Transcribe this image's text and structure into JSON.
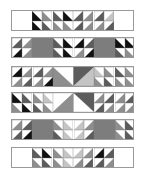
{
  "title": "",
  "colors": {
    "white": "#ffffff",
    "light": "#c4c4c4",
    "mid": "#8e8e8e",
    "dark": "#5c5c5c",
    "black": "#111111",
    "panel": "#7d7d7d",
    "border": "#9a9a9a"
  },
  "rows": [
    {
      "id": "row-1",
      "top": 10,
      "segments": [
        {
          "type": "blank",
          "x": 0,
          "w": 20
        },
        {
          "type": "hst",
          "x": 20,
          "cols": 8,
          "top": [
            "black",
            "mid",
            "dark",
            "black",
            "dark",
            "mid",
            "dark",
            "light"
          ],
          "bottom": [
            "black",
            "dark",
            "mid",
            "mid",
            "dark",
            "mid",
            "mid",
            "dark"
          ],
          "dir": [
            "d",
            "d",
            "d",
            "d",
            "a",
            "a",
            "a",
            "a"
          ]
        },
        {
          "type": "blank",
          "x": 103,
          "w": 20
        }
      ]
    },
    {
      "id": "row-2",
      "top": 37,
      "segments": [
        {
          "type": "hst",
          "x": 0,
          "cols": 2,
          "top": [
            "dark",
            "mid"
          ],
          "bottom": [
            "black",
            "mid"
          ],
          "dir": [
            "a",
            "a"
          ]
        },
        {
          "type": "panel",
          "x": 20,
          "w": 21
        },
        {
          "type": "hst",
          "x": 41,
          "cols": 4,
          "top": [
            "dark",
            "black",
            "black",
            "dark"
          ],
          "bottom": [
            "dark",
            "black",
            "mid",
            "black"
          ],
          "dir": [
            "d",
            "d",
            "a",
            "a"
          ]
        },
        {
          "type": "panel",
          "x": 82,
          "w": 21
        },
        {
          "type": "hst",
          "x": 103,
          "cols": 2,
          "top": [
            "black",
            "black"
          ],
          "bottom": [
            "dark",
            "mid"
          ],
          "dir": [
            "d",
            "d"
          ]
        }
      ]
    },
    {
      "id": "row-3",
      "top": 66,
      "segments": [
        {
          "type": "hst",
          "x": 0,
          "cols": 4,
          "top": [
            "black",
            "mid",
            "dark",
            "mid"
          ],
          "bottom": [
            "mid",
            "dark",
            "mid",
            "black"
          ],
          "dir": [
            "a",
            "a",
            "a",
            "a"
          ]
        },
        {
          "type": "big",
          "x": 41,
          "w": 41,
          "shape": "v",
          "left": "mid",
          "right": "dark",
          "center": "white"
        },
        {
          "type": "hst",
          "x": 82,
          "cols": 4,
          "top": [
            "light",
            "mid",
            "dark",
            "mid"
          ],
          "bottom": [
            "mid",
            "dark",
            "mid",
            "mid"
          ],
          "dir": [
            "d",
            "d",
            "d",
            "d"
          ]
        }
      ]
    },
    {
      "id": "row-4",
      "top": 92,
      "segments": [
        {
          "type": "hst",
          "x": 0,
          "cols": 4,
          "top": [
            "black",
            "dark",
            "mid",
            "light"
          ],
          "bottom": [
            "mid",
            "black",
            "dark",
            "mid"
          ],
          "dir": [
            "d",
            "d",
            "d",
            "d"
          ]
        },
        {
          "type": "big",
          "x": 41,
          "w": 41,
          "shape": "a",
          "left": "mid",
          "right": "dark",
          "center": "white"
        },
        {
          "type": "hst",
          "x": 82,
          "cols": 4,
          "top": [
            "mid",
            "dark",
            "mid",
            "dark"
          ],
          "bottom": [
            "dark",
            "mid",
            "mid",
            "mid"
          ],
          "dir": [
            "a",
            "a",
            "a",
            "a"
          ]
        }
      ]
    },
    {
      "id": "row-5",
      "top": 119,
      "segments": [
        {
          "type": "hst",
          "x": 0,
          "cols": 2,
          "top": [
            "mid",
            "dark"
          ],
          "bottom": [
            "dark",
            "black"
          ],
          "dir": [
            "a",
            "a"
          ]
        },
        {
          "type": "panel",
          "x": 20,
          "w": 21
        },
        {
          "type": "hst",
          "x": 41,
          "cols": 4,
          "top": [
            "mid",
            "light",
            "light",
            "mid"
          ],
          "bottom": [
            "dark",
            "light",
            "light",
            "dark"
          ],
          "dir": [
            "d",
            "d",
            "a",
            "a"
          ]
        },
        {
          "type": "panel",
          "x": 82,
          "w": 21
        },
        {
          "type": "hst",
          "x": 103,
          "cols": 2,
          "top": [
            "mid",
            "dark"
          ],
          "bottom": [
            "mid",
            "dark"
          ],
          "dir": [
            "d",
            "d"
          ]
        }
      ]
    },
    {
      "id": "row-6",
      "top": 147,
      "segments": [
        {
          "type": "blank",
          "x": 0,
          "w": 20
        },
        {
          "type": "hst",
          "x": 20,
          "cols": 8,
          "top": [
            "dark",
            "black",
            "mid",
            "light",
            "light",
            "mid",
            "black",
            "dark"
          ],
          "bottom": [
            "mid",
            "dark",
            "mid",
            "light",
            "mid",
            "dark",
            "dark",
            "mid"
          ],
          "dir": [
            "d",
            "d",
            "d",
            "d",
            "a",
            "a",
            "a",
            "a"
          ]
        },
        {
          "type": "blank",
          "x": 103,
          "w": 20
        }
      ]
    }
  ]
}
